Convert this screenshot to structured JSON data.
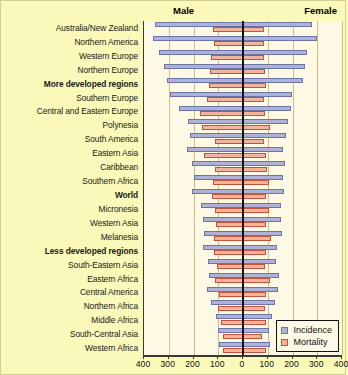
{
  "header": {
    "male_label": "Male",
    "female_label": "Female"
  },
  "legend": {
    "items": [
      {
        "label": "Incidence",
        "color": "#aeb2d6"
      },
      {
        "label": "Mortality",
        "color": "#f2b49c"
      }
    ]
  },
  "axis": {
    "tick_labels": [
      "400",
      "300",
      "200",
      "100",
      "0",
      "100",
      "200",
      "300",
      "400"
    ],
    "tick_values": [
      -400,
      -300,
      -200,
      -100,
      0,
      100,
      200,
      300,
      400
    ]
  },
  "colors": {
    "background": "#fbf9b9",
    "plot_background": "#fdf9e4",
    "gridline": "#cdbd8a",
    "incidence": "#aeb2d6",
    "incidence_border": "#6d74a8",
    "mortality": "#f2b49c",
    "mortality_border": "#c3543a",
    "zero_line": "#111111"
  },
  "chart_data": {
    "type": "bar",
    "orientation": "horizontal-diverging",
    "title": "",
    "subtitle": "",
    "xlabel": "",
    "ylabel": "",
    "xlim": [
      -400,
      400
    ],
    "grid": true,
    "legend_position": "bottom-right",
    "left_side_label": "Male",
    "right_side_label": "Female",
    "categories": [
      "Australia/New Zealand",
      "Northern America",
      "Western Europe",
      "Northern Europe",
      "More developed regions",
      "Southern Europe",
      "Central and Eastern Europe",
      "Polynesia",
      "South America",
      "Eastern Asia",
      "Caribbean",
      "Southern Africa",
      "World",
      "Micronesia",
      "Western Asia",
      "Melanesia",
      "Less developed regions",
      "South-Eastern Asia",
      "Eastern Africa",
      "Central America",
      "Northern Africa",
      "Middle Africa",
      "South-Central Asia",
      "Western Africa"
    ],
    "bold_categories": [
      "More developed regions",
      "World",
      "Less developed regions"
    ],
    "series": [
      {
        "name": "Incidence",
        "male": [
          355,
          362,
          338,
          320,
          306,
          295,
          258,
          222,
          215,
          226,
          206,
          196,
          205,
          168,
          162,
          156,
          163,
          141,
          136,
          145,
          131,
          110,
          103,
          96
        ],
        "female": [
          280,
          297,
          260,
          252,
          242,
          200,
          195,
          182,
          175,
          163,
          170,
          163,
          165,
          155,
          152,
          158,
          138,
          135,
          146,
          140,
          128,
          118,
          105,
          110
        ]
      },
      {
        "name": "Mortality",
        "male": [
          121,
          118,
          128,
          133,
          138,
          147,
          172,
          167,
          112,
          156,
          115,
          122,
          126,
          112,
          108,
          118,
          119,
          107,
          112,
          96,
          103,
          90,
          80,
          80
        ],
        "female": [
          85,
          85,
          85,
          90,
          92,
          83,
          89,
          110,
          85,
          91,
          97,
          105,
          95,
          104,
          92,
          114,
          92,
          90,
          108,
          91,
          90,
          92,
          76,
          92
        ]
      }
    ]
  }
}
